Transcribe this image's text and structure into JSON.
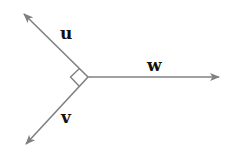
{
  "diagram": {
    "type": "vector-diagram",
    "colors": {
      "line": "#808080",
      "label": "#111111",
      "background": "#ffffff"
    },
    "origin": {
      "x": 88,
      "y": 77
    },
    "vectors": [
      {
        "name": "u",
        "label": "u",
        "tip": {
          "x": 23,
          "y": 13
        },
        "label_pos": {
          "x": 60,
          "y": 39
        }
      },
      {
        "name": "v",
        "label": "v",
        "tip": {
          "x": 25,
          "y": 145
        },
        "label_pos": {
          "x": 61,
          "y": 123
        }
      },
      {
        "name": "w",
        "label": "w",
        "tip": {
          "x": 220,
          "y": 77
        },
        "label_pos": {
          "x": 147,
          "y": 71
        }
      }
    ],
    "annotations": [
      {
        "type": "right-angle-marker",
        "between": [
          "u",
          "v"
        ]
      }
    ]
  }
}
